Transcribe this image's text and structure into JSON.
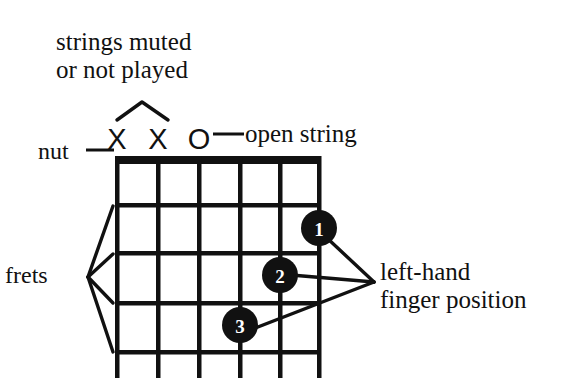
{
  "figure": {
    "background_color": "#ffffff",
    "ink_color": "#111111",
    "dot_fill": "#111111",
    "dot_text_color": "#ffffff"
  },
  "annotations": {
    "muted_strings": "strings muted\nor not played",
    "nut": "nut",
    "open_string": "open string",
    "frets": "frets",
    "finger_position": "left-hand\nfinger position"
  },
  "string_markers": [
    {
      "string": 1,
      "symbol": "X",
      "meaning": "muted"
    },
    {
      "string": 2,
      "symbol": "X",
      "meaning": "muted"
    },
    {
      "string": 3,
      "symbol": "O",
      "meaning": "open"
    }
  ],
  "finger_dots": [
    {
      "label": "1",
      "string": 6,
      "fret": 2
    },
    {
      "label": "2",
      "string": 5,
      "fret": 3
    },
    {
      "label": "3",
      "string": 4,
      "fret": 4
    }
  ],
  "fretboard": {
    "string_count": 6,
    "fret_count": 4,
    "nut_label": "nut"
  }
}
